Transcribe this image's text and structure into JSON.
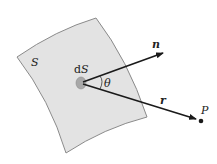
{
  "diagram": {
    "type": "surface-element-vector-diagram",
    "surface": {
      "label": "S",
      "fill": "#e3e3e3",
      "stroke": "#8a8a8a",
      "corners": [
        [
          17,
          57
        ],
        [
          96,
          18
        ],
        [
          147,
          117
        ],
        [
          66,
          153
        ]
      ]
    },
    "element": {
      "label": "dS",
      "center": [
        81,
        83
      ],
      "fill": "#a8a8a8"
    },
    "normal_vector": {
      "label": "n",
      "from": [
        81,
        83
      ],
      "to": [
        163,
        53
      ]
    },
    "position_vector": {
      "label": "r",
      "from": [
        81,
        83
      ],
      "to": [
        196,
        119
      ]
    },
    "angle": {
      "label": "θ"
    },
    "point": {
      "label": "P",
      "position": [
        201,
        121
      ]
    },
    "colors": {
      "vector": "#1a1a1a",
      "text": "#222222"
    }
  }
}
